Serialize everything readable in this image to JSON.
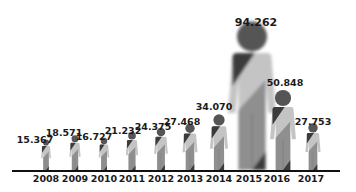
{
  "chart_data": {
    "type": "bar",
    "style": "pictogram",
    "title": "",
    "xlabel": "",
    "ylabel": "",
    "grid": false,
    "legend": null,
    "categories": [
      "2008",
      "2009",
      "2010",
      "2011",
      "2012",
      "2013",
      "2014",
      "2015",
      "2016",
      "2017"
    ],
    "values": [
      15367,
      18571,
      16727,
      21232,
      24375,
      27468,
      34070,
      94262,
      50848,
      27753
    ],
    "value_labels": [
      "15.367",
      "18.571",
      "16.727",
      "21.232",
      "24.375",
      "27.468",
      "34.070",
      "94.262",
      "50.848",
      "27.753"
    ],
    "ylim": [
      0,
      100000
    ],
    "colors": {
      "text": "#1a1a1a",
      "axis": "#111111",
      "head": "#555555",
      "body_light": "#c4c4c4",
      "body_mid": "#8f8f8f",
      "sash": "#3a3a3a"
    }
  }
}
